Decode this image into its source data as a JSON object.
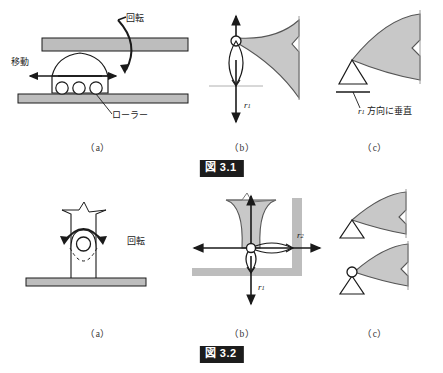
{
  "page": {
    "background_color": "#ffffff",
    "line_color": "#1a1a1a",
    "fill_gray": "#c8c8c8",
    "beam_gray": "#bdbdbd",
    "badge_bg": "#1c1c1c",
    "badge_fg": "#ffffff"
  },
  "figures": [
    {
      "id": "figure-31",
      "caption_label": "図",
      "caption_number": "3.1",
      "caption_full": "図 3.1",
      "subcaptions": [
        "（a）",
        "（b）",
        "（c）"
      ],
      "panel_a": {
        "name": "roller-support-physical",
        "labels": {
          "rotation": "回転",
          "translation": "移動",
          "roller": "ローラー"
        }
      },
      "panel_b": {
        "name": "roller-support-freedoms",
        "labels": {
          "reaction_1": "r",
          "reaction_1_sub": "1"
        }
      },
      "panel_c": {
        "name": "roller-support-symbol",
        "labels": {
          "note": "方向に垂直",
          "note_var": "r",
          "note_var_sub": "1",
          "note_full": "r1 方向に垂直"
        }
      }
    },
    {
      "id": "figure-32",
      "caption_label": "図",
      "caption_number": "3.2",
      "caption_full": "図 3.2",
      "subcaptions": [
        "（a）",
        "（b）",
        "（c）"
      ],
      "panel_a": {
        "name": "pin-support-physical",
        "labels": {
          "rotation": "回転"
        }
      },
      "panel_b": {
        "name": "pin-support-freedoms",
        "labels": {
          "reaction_1": "r",
          "reaction_1_sub": "1",
          "reaction_2": "r",
          "reaction_2_sub": "2"
        }
      },
      "panel_c": {
        "name": "pin-support-symbol",
        "labels": {}
      }
    }
  ]
}
